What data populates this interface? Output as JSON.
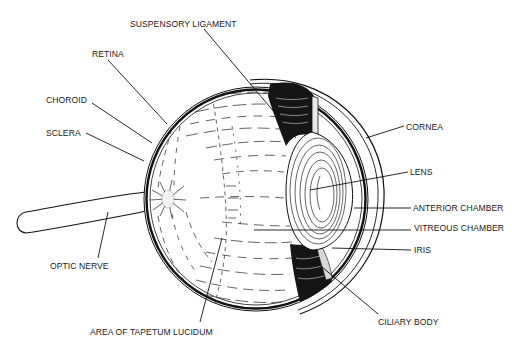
{
  "figure": {
    "colors": {
      "ink": "#111111",
      "background": "#ffffff"
    }
  },
  "labels": {
    "suspensory_ligament": "SUSPENSORY LIGAMENT",
    "retina": "RETINA",
    "choroid": "CHOROID",
    "sclera": "SCLERA",
    "cornea": "CORNEA",
    "lens": "LENS",
    "anterior_chamber": "ANTERIOR CHAMBER",
    "vitreous_chamber": "VITREOUS CHAMBER",
    "iris": "IRIS",
    "optic_nerve": "OPTIC NERVE",
    "tapetum_lucidum": "AREA OF TAPETUM LUCIDUM",
    "ciliary_body": "CILIARY BODY"
  }
}
